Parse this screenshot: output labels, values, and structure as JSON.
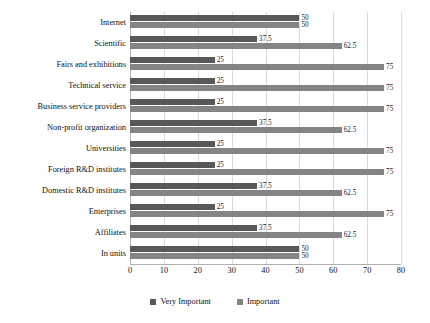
{
  "chart_data": {
    "type": "bar",
    "orientation": "horizontal",
    "title": "",
    "subtitle": "",
    "xlabel": "",
    "ylabel": "",
    "xlim": [
      0,
      80
    ],
    "xticks": [
      0,
      10,
      20,
      30,
      40,
      50,
      60,
      70,
      80
    ],
    "grid": true,
    "grid_axis": "x",
    "legend_position": "bottom",
    "categories": [
      "Internet",
      "Scientific",
      "Fairs and exhibitions",
      "Technical service",
      "Business service providers",
      "Non-profit organization",
      "Universities",
      "Foreign R&D institutes",
      "Domestic R&D institutes",
      "Enterprises",
      "Affiliates",
      "In units"
    ],
    "series": [
      {
        "name": "Very Important",
        "color": "#585858",
        "values": [
          50,
          37.5,
          25,
          25,
          25,
          37.5,
          25,
          25,
          37.5,
          25,
          37.5,
          50
        ],
        "labels": [
          "50",
          "37.5",
          "25",
          "25",
          "25",
          "37.5",
          "25",
          "25",
          "37.5",
          "25",
          "37.5",
          "50"
        ]
      },
      {
        "name": "Important",
        "color": "#848484",
        "values": [
          50,
          62.5,
          75,
          75,
          75,
          62.5,
          75,
          75,
          62.5,
          75,
          62.5,
          50
        ],
        "labels": [
          "50",
          "62.5",
          "75",
          "75",
          "75",
          "62.5",
          "75",
          "75",
          "62.5",
          "75",
          "62.5",
          "50"
        ]
      }
    ]
  },
  "legend": {
    "items": [
      {
        "label": "Very Important",
        "color": "#585858"
      },
      {
        "label": "Important",
        "color": "#848484"
      }
    ]
  },
  "axis": {
    "x_tick_labels": [
      "0",
      "10",
      "20",
      "30",
      "40",
      "50",
      "60",
      "70",
      "80"
    ]
  }
}
